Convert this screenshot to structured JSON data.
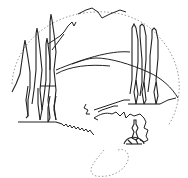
{
  "image": {
    "description": "Line-art drawing of a landscape with cypress trees and rolling hills inside a dotted circle",
    "background": "#ffffff",
    "stroke_color": "#222222",
    "dotted_color": "#999999"
  },
  "elements": [
    {
      "name": "dotted-circle-frame"
    },
    {
      "name": "cypress-trees-left",
      "count": 4
    },
    {
      "name": "cypress-trees-right",
      "count": 3
    },
    {
      "name": "rolling-hills"
    },
    {
      "name": "mountain-peak"
    },
    {
      "name": "winding-path"
    },
    {
      "name": "shrub-cluster"
    },
    {
      "name": "small-figure"
    }
  ]
}
